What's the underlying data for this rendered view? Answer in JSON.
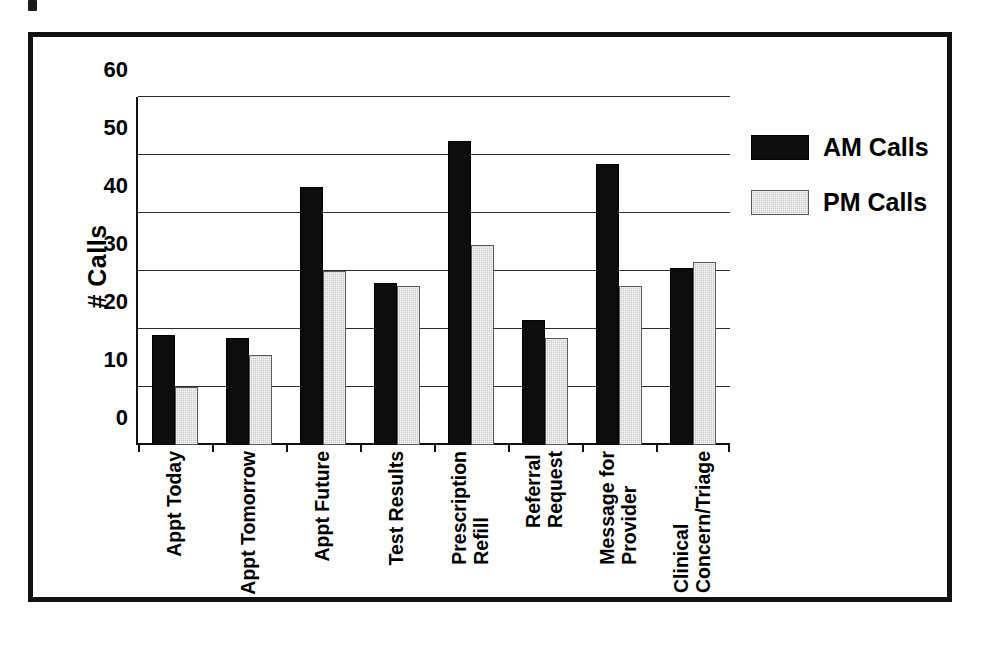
{
  "figure": {
    "background_color": "#ffffff",
    "frame_color": "#111111"
  },
  "chart_data": {
    "type": "bar",
    "title": "",
    "xlabel": "",
    "ylabel": "# Calls",
    "ylim": [
      0,
      60
    ],
    "yticks": [
      0,
      10,
      20,
      30,
      40,
      50,
      60
    ],
    "ytick_labels": [
      "0",
      "10",
      "20",
      "30",
      "40",
      "50",
      "60"
    ],
    "grid": true,
    "grid_axis": "y",
    "legend_position": "right",
    "categories": [
      "Appt Today",
      "Appt Tomorrow",
      "Appt Future",
      "Test Results",
      "Prescription Refill",
      "Referral Request",
      "Message for Provider",
      "Clinical Concern/Triage"
    ],
    "category_lines": [
      [
        "Appt Today",
        ""
      ],
      [
        "Appt Tomorrow",
        ""
      ],
      [
        "Appt Future",
        ""
      ],
      [
        "Test Results",
        ""
      ],
      [
        "Prescription",
        "Refill"
      ],
      [
        "Referral",
        "Request"
      ],
      [
        "Message for",
        "Provider"
      ],
      [
        "Clinical",
        "Concern/Triage"
      ]
    ],
    "series": [
      {
        "name": "AM Calls",
        "color": "#0d0d0d",
        "values": [
          19,
          18.5,
          44.5,
          28,
          52.5,
          21.5,
          48.5,
          30.5
        ]
      },
      {
        "name": "PM Calls",
        "color": "#c9c9c9",
        "values": [
          10,
          15.5,
          30,
          27.5,
          34.5,
          18.5,
          27.5,
          31.5
        ]
      }
    ]
  },
  "legend": {
    "items": [
      {
        "label": "AM Calls",
        "swatch": "black-solid"
      },
      {
        "label": "PM Calls",
        "swatch": "gray-hatched"
      }
    ]
  }
}
